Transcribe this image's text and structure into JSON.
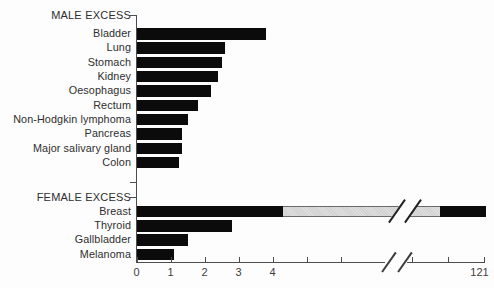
{
  "figure": {
    "background": "#fdfdfd",
    "kind": "horizontal-bar-chart-with-axis-break"
  },
  "chart_data": {
    "type": "bar",
    "orientation": "horizontal",
    "title": "",
    "xlabel": "",
    "ylabel": "",
    "grid": false,
    "legend": null,
    "x_axis": {
      "labeled_ticks": [
        {
          "label": "0",
          "value": 0
        },
        {
          "label": "1",
          "value": 1
        },
        {
          "label": "2",
          "value": 2
        },
        {
          "label": "3",
          "value": 3
        },
        {
          "label": "4",
          "value": 4
        }
      ],
      "unlabeled_tick_values": [
        5,
        6
      ],
      "has_break": true,
      "end_label": "121",
      "end_value": 121
    },
    "sections": [
      {
        "label": "MALE EXCESS",
        "bars": [
          {
            "label": "Bladder",
            "value": 3.8
          },
          {
            "label": "Lung",
            "value": 2.6
          },
          {
            "label": "Stomach",
            "value": 2.5
          },
          {
            "label": "Kidney",
            "value": 2.4
          },
          {
            "label": "Oesophagus",
            "value": 2.2
          },
          {
            "label": "Rectum",
            "value": 1.8
          },
          {
            "label": "Non-Hodgkin lymphoma",
            "value": 1.5
          },
          {
            "label": "Pancreas",
            "value": 1.35
          },
          {
            "label": "Major salivary gland",
            "value": 1.35
          },
          {
            "label": "Colon",
            "value": 1.25
          }
        ]
      },
      {
        "label": "FEMALE EXCESS",
        "bars": [
          {
            "label": "Breast",
            "value": 121,
            "broken": true,
            "solid_until_value": 4.3
          },
          {
            "label": "Thyroid",
            "value": 2.8
          },
          {
            "label": "Gallbladder",
            "value": 1.5
          },
          {
            "label": "Melanoma",
            "value": 1.1
          }
        ]
      }
    ],
    "colors": {
      "bar": "#0b0b0b",
      "break_segment_fill": "#d7d7d7",
      "axis": "#4d4d4d",
      "text": "#2e2e2e"
    }
  }
}
